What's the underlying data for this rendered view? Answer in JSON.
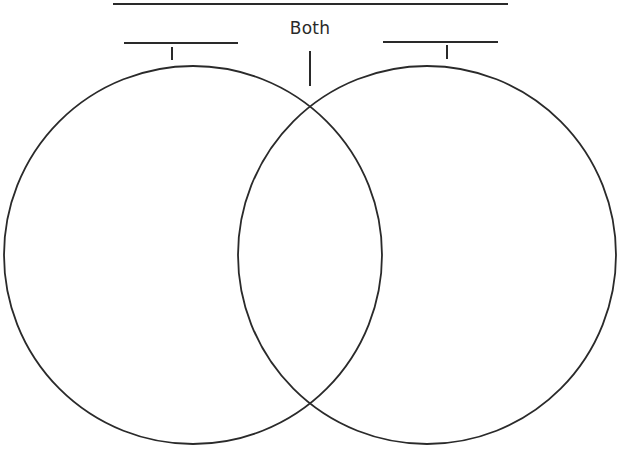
{
  "diagram": {
    "type": "venn",
    "title_line": {
      "x1": 113,
      "x2": 508,
      "y": 4
    },
    "both_label": "Both",
    "left_set": {
      "label_line": {
        "x1": 124,
        "x2": 238,
        "y": 43
      },
      "tick": {
        "x": 172,
        "y1": 47,
        "y2": 60
      },
      "circle": {
        "cx": 193,
        "cy": 255,
        "r": 189
      }
    },
    "right_set": {
      "label_line": {
        "x1": 383,
        "x2": 498,
        "y": 42
      },
      "tick": {
        "x": 447,
        "y1": 45,
        "y2": 59
      },
      "circle": {
        "cx": 427,
        "cy": 255,
        "r": 189
      }
    },
    "both_tick": {
      "x": 310,
      "y1": 51,
      "y2": 86
    },
    "stroke_color": "#2a2a2a"
  }
}
